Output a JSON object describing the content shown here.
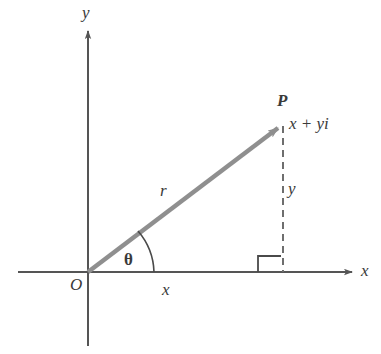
{
  "figure": {
    "colors": {
      "axis": "#555555",
      "vector": "#8f8f8f",
      "dashed": "#6e6e6e",
      "text": "#3a3a3a",
      "background": "#ffffff"
    },
    "labels": {
      "axis_y": "y",
      "axis_x": "x",
      "origin": "O",
      "point": "P",
      "point_value": "x + yi",
      "radius": "r",
      "angle": "θ",
      "leg_vertical": "y",
      "leg_horizontal": "x"
    },
    "geometry": {
      "origin": {
        "x": 88,
        "y": 272
      },
      "point_p": {
        "x": 283,
        "y": 124
      },
      "x_axis": {
        "x1": 18,
        "y1": 272,
        "x2": 355,
        "y2": 272
      },
      "y_axis": {
        "x1": 88,
        "y1": 28,
        "x2": 88,
        "y2": 346
      },
      "angle_arc_radius": 66,
      "right_angle_box": {
        "x": 258,
        "y": 256,
        "size": 24
      },
      "dashed_line": {
        "x": 283,
        "y1": 126,
        "y2": 272
      }
    }
  }
}
